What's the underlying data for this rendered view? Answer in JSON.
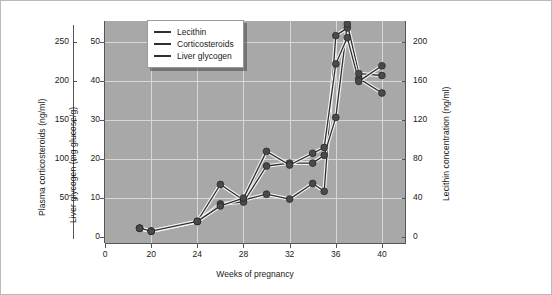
{
  "chart_data": {
    "type": "line",
    "title": "",
    "xlabel": "Weeks of pregnancy",
    "x_ticks": [
      "0",
      "20",
      "24",
      "28",
      "32",
      "36",
      "40"
    ],
    "x_broken_axis": true,
    "grid": true,
    "legend_position": "top-left-inside",
    "plot_background": "#a8a8a8",
    "gridline_color": "#d8d8d8",
    "line_color": "#2f2f2f",
    "marker_color": "#4a4a4a",
    "axes": [
      {
        "name": "plasma-corticosteroids",
        "side": "left-outer",
        "ylabel": "Plasma corticosteroids (ng/ml)",
        "ticks": [
          "50",
          "100",
          "150",
          "200",
          "250"
        ],
        "ylim": [
          0,
          275
        ]
      },
      {
        "name": "liver-glycogen",
        "side": "left-inner",
        "ylabel": "Liver glycogen (mg glucose/g)",
        "ticks": [
          "0",
          "10",
          "20",
          "30",
          "40",
          "50"
        ],
        "ylim": [
          0,
          55
        ]
      },
      {
        "name": "lecithin-concentration",
        "side": "right",
        "ylabel": "Lecithin concentration (ng/ml)",
        "ticks": [
          "0",
          "40",
          "80",
          "120",
          "160",
          "200"
        ],
        "ylim": [
          0,
          220
        ]
      }
    ],
    "series": [
      {
        "name": "Lecithin",
        "axis": "lecithin-concentration",
        "x": [
          18,
          20,
          24,
          26,
          28,
          30,
          32,
          34,
          35,
          36,
          37,
          38,
          40
        ],
        "values": [
          9,
          6,
          16,
          54,
          38,
          44,
          39,
          55,
          47,
          207,
          215,
          163,
          148
        ]
      },
      {
        "name": "Corticosteroids",
        "axis": "plasma-corticosteroids",
        "x": [
          18,
          20,
          24,
          26,
          28,
          30,
          32,
          34,
          35,
          36,
          37,
          38,
          40
        ],
        "values": [
          9,
          6,
          16,
          34,
          36,
          73,
          76,
          76,
          84,
          123,
          219,
          168,
          166
        ]
      },
      {
        "name": "Liver glycogen",
        "axis": "liver-glycogen",
        "x": [
          18,
          20,
          24,
          26,
          28,
          30,
          32,
          34,
          35,
          36,
          37,
          38,
          40
        ],
        "values": [
          9,
          6,
          16,
          32,
          40,
          88,
          74,
          86,
          92,
          178,
          205,
          160,
          176
        ]
      }
    ]
  },
  "legend": {
    "items": [
      {
        "label": "Lecithin"
      },
      {
        "label": "Corticosteroids"
      },
      {
        "label": "Liver glycogen"
      }
    ]
  }
}
